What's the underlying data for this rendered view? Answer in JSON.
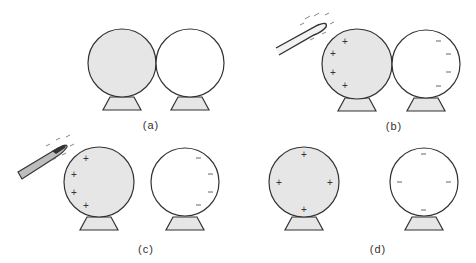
{
  "colors": {
    "charged_fill": "#e6e6e6",
    "neutral_fill": "#ffffff",
    "stroke": "#333333",
    "stand_fill": "#e6e6e6"
  },
  "panels": [
    {
      "label": "(a)",
      "left_charges": [],
      "right_charges": [],
      "rod": false,
      "spheres_touching": true
    },
    {
      "label": "(b)",
      "left_charges": [
        "+",
        "+",
        "+",
        "+"
      ],
      "right_charges": [
        "−",
        "−",
        "−",
        "−"
      ],
      "rod": true,
      "rod_charge": "−",
      "spheres_touching": true
    },
    {
      "label": "(c)",
      "left_charges": [
        "+",
        "+",
        "+",
        "+"
      ],
      "right_charges": [
        "−",
        "−",
        "−",
        "−"
      ],
      "rod": true,
      "rod_charge": "−",
      "spheres_touching": false
    },
    {
      "label": "(d)",
      "left_charges": [
        "+",
        "+",
        "+",
        "+"
      ],
      "right_charges": [
        "−",
        "−",
        "−",
        "−"
      ],
      "rod": false,
      "spheres_touching": false
    }
  ]
}
